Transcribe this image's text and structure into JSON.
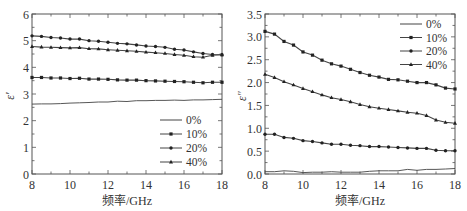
{
  "chart_data": [
    {
      "type": "line",
      "title": "",
      "xlabel": "频率/GHz",
      "ylabel": "ε′",
      "xlim": [
        8,
        18
      ],
      "ylim": [
        0,
        6
      ],
      "xticks": [
        8,
        10,
        12,
        14,
        16,
        18
      ],
      "yticks": [
        0,
        1,
        2,
        3,
        4,
        5,
        6
      ],
      "grid": false,
      "legend_position": "lower right",
      "x": [
        8,
        8.5,
        9,
        9.5,
        10,
        10.5,
        11,
        11.5,
        12,
        12.5,
        13,
        13.5,
        14,
        14.5,
        15,
        15.5,
        16,
        16.5,
        17,
        17.5,
        18
      ],
      "series": [
        {
          "name": "0%",
          "marker": "none",
          "values": [
            2.62,
            2.63,
            2.63,
            2.64,
            2.66,
            2.67,
            2.68,
            2.7,
            2.7,
            2.73,
            2.72,
            2.75,
            2.75,
            2.76,
            2.76,
            2.77,
            2.76,
            2.78,
            2.78,
            2.79,
            2.8
          ]
        },
        {
          "name": "10%",
          "marker": "square",
          "values": [
            3.62,
            3.62,
            3.6,
            3.6,
            3.58,
            3.59,
            3.56,
            3.56,
            3.55,
            3.53,
            3.52,
            3.52,
            3.5,
            3.49,
            3.48,
            3.47,
            3.46,
            3.44,
            3.42,
            3.44,
            3.44
          ]
        },
        {
          "name": "20%",
          "marker": "circle",
          "values": [
            5.18,
            5.16,
            5.12,
            5.1,
            5.06,
            5.06,
            5.0,
            4.98,
            4.94,
            4.9,
            4.88,
            4.84,
            4.8,
            4.78,
            4.75,
            4.68,
            4.65,
            4.58,
            4.52,
            4.48,
            4.47
          ]
        },
        {
          "name": "40%",
          "marker": "triangle",
          "values": [
            4.78,
            4.76,
            4.75,
            4.74,
            4.73,
            4.74,
            4.7,
            4.69,
            4.66,
            4.64,
            4.62,
            4.6,
            4.57,
            4.55,
            4.52,
            4.48,
            4.45,
            4.4,
            4.38,
            4.45,
            4.47
          ]
        }
      ]
    },
    {
      "type": "line",
      "title": "",
      "xlabel": "频率/GHz",
      "ylabel": "ε″",
      "xlim": [
        8,
        18
      ],
      "ylim": [
        0,
        3.5
      ],
      "xticks": [
        8,
        10,
        12,
        14,
        16,
        18
      ],
      "yticks": [
        0.0,
        0.5,
        1.0,
        1.5,
        2.0,
        2.5,
        3.0,
        3.5
      ],
      "grid": false,
      "legend_position": "upper right",
      "x": [
        8,
        8.5,
        9,
        9.5,
        10,
        10.5,
        11,
        11.5,
        12,
        12.5,
        13,
        13.5,
        14,
        14.5,
        15,
        15.5,
        16,
        16.5,
        17,
        17.5,
        18
      ],
      "series": [
        {
          "name": "0%",
          "marker": "none",
          "values": [
            0.05,
            0.05,
            0.07,
            0.06,
            0.03,
            0.04,
            0.04,
            0.05,
            0.04,
            0.04,
            0.04,
            0.06,
            0.07,
            0.07,
            0.07,
            0.1,
            0.08,
            0.1,
            0.1,
            0.11,
            0.12
          ]
        },
        {
          "name": "10%",
          "marker": "square",
          "values": [
            3.12,
            3.06,
            2.9,
            2.82,
            2.67,
            2.6,
            2.49,
            2.41,
            2.36,
            2.29,
            2.22,
            2.16,
            2.12,
            2.07,
            2.06,
            2.03,
            2.0,
            2.0,
            1.95,
            1.88,
            1.86
          ]
        },
        {
          "name": "20%",
          "marker": "circle",
          "values": [
            0.87,
            0.87,
            0.8,
            0.78,
            0.73,
            0.71,
            0.68,
            0.65,
            0.65,
            0.63,
            0.62,
            0.6,
            0.6,
            0.59,
            0.58,
            0.57,
            0.56,
            0.56,
            0.52,
            0.51,
            0.51
          ]
        },
        {
          "name": "40%",
          "marker": "triangle",
          "values": [
            2.18,
            2.11,
            2.02,
            1.95,
            1.87,
            1.8,
            1.73,
            1.67,
            1.63,
            1.58,
            1.52,
            1.47,
            1.44,
            1.41,
            1.38,
            1.35,
            1.33,
            1.28,
            1.18,
            1.13,
            1.11
          ]
        }
      ]
    }
  ],
  "colors": {
    "axis": "#555555",
    "line": "#444444",
    "marker": "#222222",
    "text": "#333333"
  }
}
